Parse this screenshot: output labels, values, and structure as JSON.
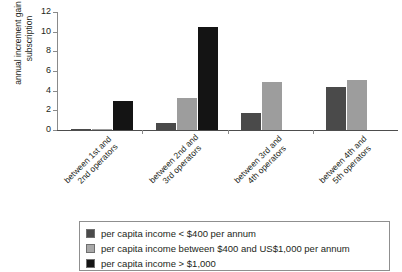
{
  "chart_data": {
    "type": "bar",
    "title": "annual increment gain in subscription by operator entry and per capita income",
    "xlabel": "",
    "ylabel": "annual increment gain in subscription",
    "ylabel_line1": "annual increment gain in",
    "ylabel_line2": "subscription",
    "ylim": [
      0,
      12
    ],
    "yticks": [
      0,
      2,
      4,
      6,
      8,
      10,
      12
    ],
    "ytick_labels": [
      "0",
      "2",
      "4",
      "6",
      "8",
      "10",
      "12"
    ],
    "grid": false,
    "legend_position": "bottom",
    "categories": [
      "between 1st and 2nd operators",
      "between 2nd and 3rd operators",
      "between 3rd and 4th operators",
      "between 4th and 5th operators"
    ],
    "category_lines": [
      [
        "between 1st and",
        "2nd operators"
      ],
      [
        "between 2nd and",
        "3rd operators"
      ],
      [
        "between 3rd and",
        "4th operators"
      ],
      [
        "between 4th and",
        "5th operators"
      ]
    ],
    "series": [
      {
        "name": "per capita income < $400 per annum",
        "color": "#4a4a4a",
        "values": [
          0.05,
          0.7,
          1.7,
          4.4
        ]
      },
      {
        "name": "per capita income between $400 and US$1,000 per annum",
        "color": "#9d9d9d",
        "values": [
          0.15,
          3.25,
          4.85,
          5.1
        ]
      },
      {
        "name": "per capita income > $1,000",
        "color": "#141414",
        "values": [
          2.9,
          10.5,
          0,
          0
        ]
      }
    ]
  },
  "legend": {
    "items": [
      {
        "label": "per capita income < $400 per annum",
        "swatch": "dark"
      },
      {
        "label": "per capita income between $400 and US$1,000 per annum",
        "swatch": "light"
      },
      {
        "label": "per capita income > $1,000",
        "swatch": "black"
      }
    ]
  },
  "axis": {
    "y_tick_0": "0",
    "y_tick_1": "2",
    "y_tick_2": "4",
    "y_tick_3": "6",
    "y_tick_4": "8",
    "y_tick_5": "10",
    "y_tick_6": "12"
  }
}
